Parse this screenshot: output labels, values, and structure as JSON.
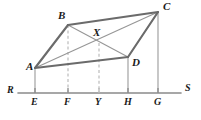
{
  "figure": {
    "canvas": {
      "width": 201,
      "height": 120,
      "background": "#ffffff"
    },
    "colors": {
      "solid_edge": "#6b6b6b",
      "thin_edge": "#8c8c8c",
      "dashed_guide": "#b5b5b5",
      "baseline": "#8a8a8a",
      "label_text": "#1a1a1a"
    }
  },
  "points": [
    {
      "id": "A",
      "label": "A",
      "x": 35,
      "y": 68,
      "label_x": 26,
      "label_y": 61
    },
    {
      "id": "B",
      "label": "B",
      "x": 68,
      "y": 25,
      "label_x": 58,
      "label_y": 10
    },
    {
      "id": "C",
      "label": "C",
      "x": 158,
      "y": 12,
      "label_x": 163,
      "label_y": 1
    },
    {
      "id": "D",
      "label": "D",
      "x": 128,
      "y": 57,
      "label_x": 132,
      "label_y": 57
    },
    {
      "id": "X",
      "label": "X",
      "x": 99,
      "y": 43,
      "label_x": 93,
      "label_y": 27
    }
  ],
  "baseline": {
    "label_left": "R",
    "label_right": "S",
    "y": 93,
    "x_start": 18,
    "x_end": 181,
    "label_left_x": 7,
    "label_left_y": 85,
    "label_right_x": 185,
    "label_right_y": 83
  },
  "foot_points": [
    {
      "id": "E",
      "label": "E",
      "x": 35,
      "label_x": 31,
      "label_y": 97,
      "from": "A",
      "style": "solid"
    },
    {
      "id": "F",
      "label": "F",
      "x": 68,
      "label_x": 64,
      "label_y": 97,
      "from": "B",
      "style": "dashed"
    },
    {
      "id": "Y",
      "label": "Y",
      "x": 99,
      "label_x": 95,
      "label_y": 97,
      "from": "X",
      "style": "dashed"
    },
    {
      "id": "H",
      "label": "H",
      "x": 128,
      "label_x": 124,
      "label_y": 97,
      "from": "D",
      "style": "solid"
    },
    {
      "id": "G",
      "label": "G",
      "x": 158,
      "label_x": 154,
      "label_y": 97,
      "from": "C",
      "style": "solid"
    }
  ],
  "edges": [
    {
      "id": "AB",
      "from": "A",
      "to": "B",
      "style": "solid-thick"
    },
    {
      "id": "BC",
      "from": "B",
      "to": "C",
      "style": "solid-thick"
    },
    {
      "id": "CD",
      "from": "C",
      "to": "D",
      "style": "solid-thick"
    },
    {
      "id": "DA",
      "from": "D",
      "to": "A",
      "style": "solid-thick"
    }
  ],
  "diagonals": [
    {
      "id": "AC",
      "from": "A",
      "to": "C",
      "style": "thin"
    },
    {
      "id": "BD",
      "from": "B",
      "to": "D",
      "style": "thin"
    }
  ]
}
